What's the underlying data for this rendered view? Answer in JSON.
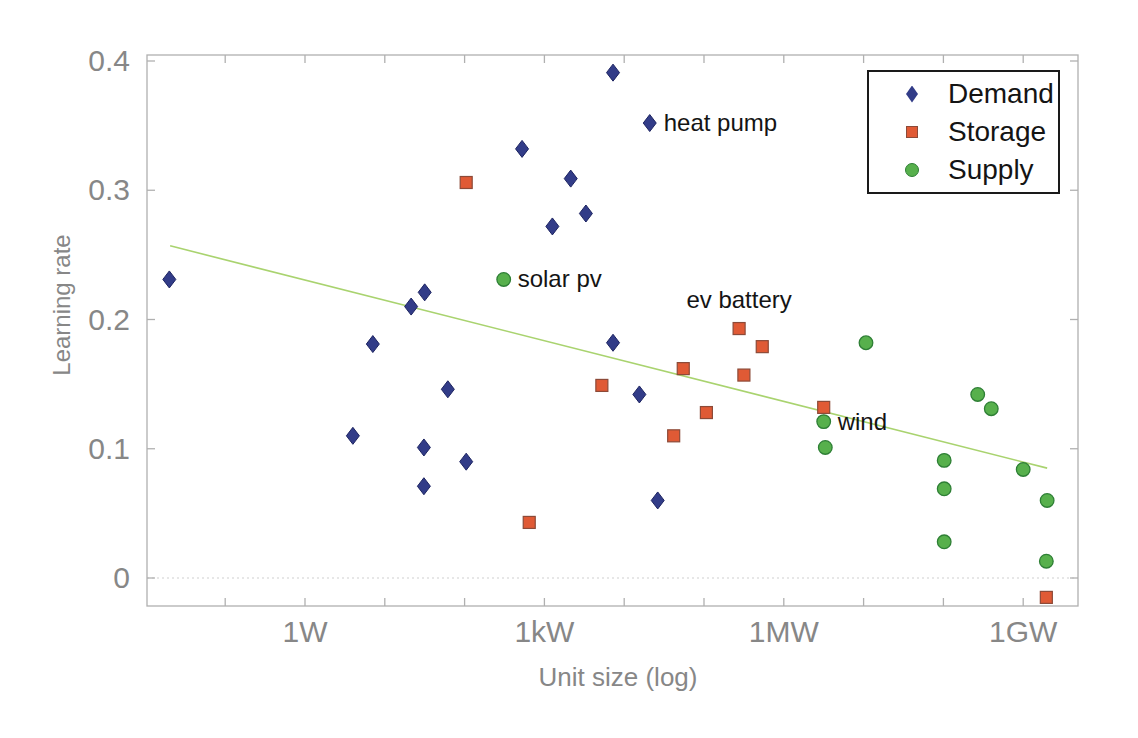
{
  "chart_data": {
    "type": "scatter",
    "title": "",
    "xlabel": "Unit size (log)",
    "ylabel": "Learning rate",
    "x_scale": "log10 of unit size in watts",
    "xlim_log10w": [
      -1.98,
      9.69
    ],
    "ylim": [
      -0.022,
      0.405
    ],
    "grid": false,
    "zero_line": true,
    "legend_position": "top-right",
    "x_ticks": [
      {
        "log10w": 0,
        "label": "1W"
      },
      {
        "log10w": 3,
        "label": "1kW"
      },
      {
        "log10w": 6,
        "label": "1MW"
      },
      {
        "log10w": 9,
        "label": "1GW"
      }
    ],
    "x_minor_ticks_log10w": [
      -1,
      0,
      1,
      2,
      3,
      4,
      5,
      6,
      7,
      8,
      9
    ],
    "y_ticks": [
      {
        "value": 0.4,
        "label": "0.4"
      },
      {
        "value": 0.3,
        "label": "0.3"
      },
      {
        "value": 0.2,
        "label": "0.2"
      },
      {
        "value": 0.1,
        "label": "0.1"
      },
      {
        "value": 0.0,
        "label": "0"
      }
    ],
    "series": [
      {
        "name": "Demand",
        "marker": "diamond",
        "color": "#323c88",
        "edge_color": "#1d2461",
        "points": [
          {
            "x_log10w": -1.7,
            "y": 0.231
          },
          {
            "x_log10w": 0.6,
            "y": 0.11
          },
          {
            "x_log10w": 0.85,
            "y": 0.181
          },
          {
            "x_log10w": 1.33,
            "y": 0.21
          },
          {
            "x_log10w": 1.49,
            "y": 0.101
          },
          {
            "x_log10w": 1.49,
            "y": 0.071
          },
          {
            "x_log10w": 1.5,
            "y": 0.221
          },
          {
            "x_log10w": 1.79,
            "y": 0.146
          },
          {
            "x_log10w": 2.02,
            "y": 0.09
          },
          {
            "x_log10w": 2.72,
            "y": 0.332
          },
          {
            "x_log10w": 3.1,
            "y": 0.272
          },
          {
            "x_log10w": 3.33,
            "y": 0.309
          },
          {
            "x_log10w": 3.52,
            "y": 0.282
          },
          {
            "x_log10w": 3.86,
            "y": 0.391
          },
          {
            "x_log10w": 3.86,
            "y": 0.182
          },
          {
            "x_log10w": 4.19,
            "y": 0.142
          },
          {
            "x_log10w": 4.32,
            "y": 0.352
          },
          {
            "x_log10w": 4.42,
            "y": 0.06
          }
        ]
      },
      {
        "name": "Storage",
        "marker": "square",
        "color": "#e05a35",
        "edge_color": "#8c4a38",
        "points": [
          {
            "x_log10w": 2.02,
            "y": 0.306
          },
          {
            "x_log10w": 2.81,
            "y": 0.043
          },
          {
            "x_log10w": 3.72,
            "y": 0.149
          },
          {
            "x_log10w": 4.62,
            "y": 0.11
          },
          {
            "x_log10w": 4.74,
            "y": 0.162
          },
          {
            "x_log10w": 5.03,
            "y": 0.128
          },
          {
            "x_log10w": 5.44,
            "y": 0.193
          },
          {
            "x_log10w": 5.5,
            "y": 0.157
          },
          {
            "x_log10w": 5.73,
            "y": 0.179
          },
          {
            "x_log10w": 6.5,
            "y": 0.132
          },
          {
            "x_log10w": 9.29,
            "y": -0.015
          }
        ]
      },
      {
        "name": "Supply",
        "marker": "circle",
        "color": "#57b04c",
        "edge_color": "#2e7f35",
        "points": [
          {
            "x_log10w": 2.49,
            "y": 0.231
          },
          {
            "x_log10w": 6.5,
            "y": 0.121
          },
          {
            "x_log10w": 6.52,
            "y": 0.101
          },
          {
            "x_log10w": 7.03,
            "y": 0.182
          },
          {
            "x_log10w": 8.01,
            "y": 0.091
          },
          {
            "x_log10w": 8.01,
            "y": 0.069
          },
          {
            "x_log10w": 8.01,
            "y": 0.028
          },
          {
            "x_log10w": 8.43,
            "y": 0.142
          },
          {
            "x_log10w": 8.6,
            "y": 0.131
          },
          {
            "x_log10w": 9.0,
            "y": 0.084
          },
          {
            "x_log10w": 9.3,
            "y": 0.06
          },
          {
            "x_log10w": 9.29,
            "y": 0.013
          }
        ]
      }
    ],
    "trend_line": {
      "color": "#a9d36f",
      "from": {
        "x_log10w": -1.69,
        "y": 0.257
      },
      "to": {
        "x_log10w": 9.3,
        "y": 0.085
      }
    },
    "annotations": [
      {
        "text": "heat pump",
        "x_log10w": 4.32,
        "y": 0.352,
        "placement": "right"
      },
      {
        "text": "solar pv",
        "x_log10w": 2.49,
        "y": 0.231,
        "placement": "right"
      },
      {
        "text": "ev battery",
        "x_log10w": 5.44,
        "y": 0.193,
        "placement": "above"
      },
      {
        "text": "wind",
        "x_log10w": 6.5,
        "y": 0.121,
        "placement": "right"
      }
    ],
    "axis_color": "#b0b0b0",
    "tick_label_color": "#878787"
  }
}
